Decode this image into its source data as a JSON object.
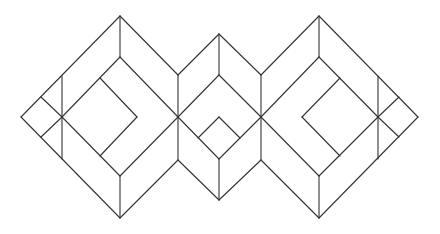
{
  "diagram": {
    "title": "",
    "stroke_color": "#333333",
    "background": "#ffffff",
    "lines": [
      [
        120,
        16,
        21,
        117
      ],
      [
        21,
        117,
        120,
        218
      ],
      [
        120,
        16,
        178,
        75
      ],
      [
        120,
        218,
        178,
        160
      ],
      [
        120,
        16,
        120,
        57
      ],
      [
        120,
        176,
        120,
        218
      ],
      [
        62,
        76,
        62,
        159
      ],
      [
        41,
        97,
        62,
        117
      ],
      [
        41,
        137,
        62,
        117
      ],
      [
        120,
        57,
        62,
        117
      ],
      [
        120,
        57,
        178,
        117
      ],
      [
        62,
        117,
        120,
        176
      ],
      [
        120,
        176,
        178,
        117
      ],
      [
        100,
        78,
        137,
        117
      ],
      [
        137,
        117,
        100,
        156
      ],
      [
        178,
        75,
        178,
        160
      ],
      [
        178,
        75,
        219,
        34
      ],
      [
        219,
        34,
        261,
        75
      ],
      [
        178,
        160,
        219,
        200
      ],
      [
        219,
        200,
        261,
        160
      ],
      [
        219,
        34,
        219,
        75
      ],
      [
        219,
        159,
        219,
        200
      ],
      [
        219,
        75,
        178,
        117
      ],
      [
        219,
        75,
        261,
        117
      ],
      [
        178,
        117,
        219,
        159
      ],
      [
        261,
        117,
        219,
        159
      ],
      [
        219,
        117,
        198,
        138
      ],
      [
        219,
        117,
        240,
        138
      ],
      [
        261,
        75,
        261,
        160
      ],
      [
        261,
        75,
        319,
        16
      ],
      [
        319,
        16,
        418,
        117
      ],
      [
        418,
        117,
        319,
        218
      ],
      [
        319,
        218,
        261,
        160
      ],
      [
        319,
        16,
        319,
        57
      ],
      [
        319,
        176,
        319,
        218
      ],
      [
        378,
        76,
        378,
        159
      ],
      [
        399,
        97,
        378,
        117
      ],
      [
        399,
        137,
        378,
        117
      ],
      [
        319,
        57,
        261,
        117
      ],
      [
        319,
        57,
        378,
        117
      ],
      [
        261,
        117,
        319,
        176
      ],
      [
        319,
        176,
        378,
        117
      ],
      [
        340,
        78,
        302,
        117
      ],
      [
        302,
        117,
        340,
        156
      ]
    ]
  }
}
